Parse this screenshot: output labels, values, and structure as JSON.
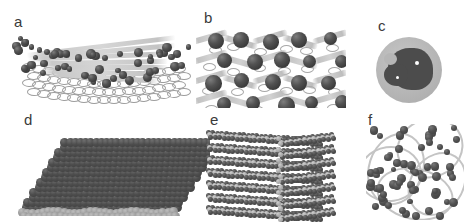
{
  "figure": {
    "background_color": "#ffffff",
    "width": 468,
    "height": 224,
    "panel_count": 6,
    "colors": {
      "sphere_dark": "#4a4a4a",
      "sphere_outline": "#303030",
      "sheet_gray": "#c8c8c8",
      "sublayer_gray": "#8a8a8a",
      "halo_gray": "#b6b6b6",
      "label_color": "#3a3a3a",
      "highlight": "#ffffff"
    }
  },
  "panels": [
    {
      "id": "a",
      "label": "a",
      "description": "curved layered nanosheet with scattered dark nanoparticles on the surface and a honeycomb mesh lattice visible underneath",
      "sheet_count": 7,
      "particle_count": 54
    },
    {
      "id": "b",
      "label": "b",
      "description": "cross-sectional view of nanoparticles intercalated between undulating gray layers",
      "sheet_count": 4,
      "particle_count": 20
    },
    {
      "id": "c",
      "label": "c",
      "description": "single nanoparticle: dark irregular core with two white highlight specks inside a light gray spherical halo",
      "highlight_count": 2
    },
    {
      "id": "d",
      "label": "d",
      "description": "dense close-packed monolayer sheet of dark spheres in perspective with a lighter sublayer along the bottom edge",
      "rows": 14,
      "sublayer_rows": 2
    },
    {
      "id": "e",
      "label": "e",
      "description": "three-dimensional stack of layered sheets viewed in perspective",
      "layer_count": 7
    },
    {
      "id": "f",
      "label": "f",
      "description": "dispersed dark nanoparticles with light gray ribbon chains weaving between them",
      "particle_count": 62,
      "ribbon_count": 5
    }
  ]
}
